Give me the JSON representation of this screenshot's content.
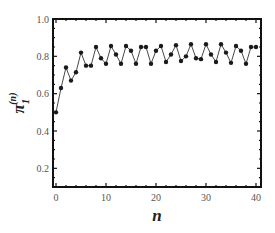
{
  "chart_data": {
    "type": "line",
    "title": "",
    "xlabel": "n",
    "ylabel": "π1(n)",
    "ylabel_main": "π",
    "ylabel_sub": "1",
    "ylabel_sup": "(n)",
    "xlim": [
      0,
      40
    ],
    "ylim": [
      0.1,
      1.0
    ],
    "grid": false,
    "legend": null,
    "markers": true,
    "x_ticks": [
      0,
      10,
      20,
      30,
      40
    ],
    "x_tick_labels": [
      "0",
      "10",
      "20",
      "30",
      "40"
    ],
    "y_ticks": [
      0.2,
      0.4,
      0.6,
      0.8,
      1.0
    ],
    "y_tick_labels": [
      "0.2",
      "0.4",
      "0.6",
      "0.8",
      "1.0"
    ],
    "series": [
      {
        "name": "π1(n)",
        "color": "#1a1a1a",
        "x": [
          0,
          1,
          2,
          3,
          4,
          5,
          6,
          7,
          8,
          9,
          10,
          11,
          12,
          13,
          14,
          15,
          16,
          17,
          18,
          19,
          20,
          21,
          22,
          23,
          24,
          25,
          26,
          27,
          28,
          29,
          30,
          31,
          32,
          33,
          34,
          35,
          36,
          37,
          38,
          39,
          40
        ],
        "values": [
          0.5,
          0.63,
          0.74,
          0.67,
          0.715,
          0.82,
          0.75,
          0.75,
          0.85,
          0.79,
          0.76,
          0.855,
          0.81,
          0.76,
          0.855,
          0.83,
          0.76,
          0.85,
          0.85,
          0.76,
          0.83,
          0.855,
          0.77,
          0.81,
          0.86,
          0.775,
          0.8,
          0.865,
          0.79,
          0.785,
          0.865,
          0.81,
          0.77,
          0.865,
          0.82,
          0.765,
          0.855,
          0.83,
          0.76,
          0.85,
          0.85
        ]
      }
    ]
  }
}
